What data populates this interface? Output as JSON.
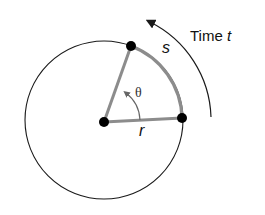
{
  "diagram": {
    "type": "circular-motion-arc-length",
    "labels": {
      "time_prefix": "Time",
      "time_var": "t",
      "arc": "s",
      "angle": "θ",
      "radius": "r"
    },
    "colors": {
      "circle": "#1a1a1a",
      "sector": "#8c8c8c",
      "points": "#000000",
      "arrow": "#1a1a1a"
    }
  }
}
